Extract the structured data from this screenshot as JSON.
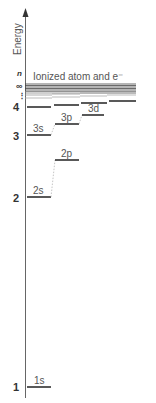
{
  "axis": {
    "label": "Energy",
    "n_label": "n",
    "infinity_label": "∞",
    "dots_label": "⋮"
  },
  "ionized_label": "Ionized atom and e⁻",
  "n_ticks": [
    "1",
    "2",
    "3",
    "4"
  ],
  "levels": {
    "s1": "1s",
    "s2": "2s",
    "p2": "2p",
    "s3": "3s",
    "p3": "3p",
    "d3": "3d"
  },
  "colors": {
    "line": "#222222",
    "text": "#555555",
    "axis": "#555555"
  }
}
